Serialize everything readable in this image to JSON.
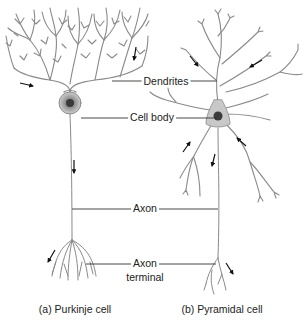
{
  "figure": {
    "labels": {
      "dendrites": "Dendrites",
      "cell_body": "Cell body",
      "axon": "Axon",
      "axon_terminal_line1": "Axon",
      "axon_terminal_line2": "terminal"
    },
    "captions": {
      "a": "(a) Purkinje cell",
      "b": "(b) Pyramidal cell"
    },
    "cells": [
      {
        "id": "purkinje",
        "parts": [
          "dendrites",
          "cell body",
          "axon",
          "axon terminal"
        ],
        "arrows": 4
      },
      {
        "id": "pyramidal",
        "parts": [
          "dendrites",
          "cell body",
          "axon",
          "axon terminal"
        ],
        "arrows": 6
      }
    ],
    "colors": {
      "line": "#8a8a8a",
      "soma_fill": "#c8c8c8",
      "nucleus": "#3a3a3a",
      "arrow": "#111111",
      "text": "#222222"
    }
  }
}
